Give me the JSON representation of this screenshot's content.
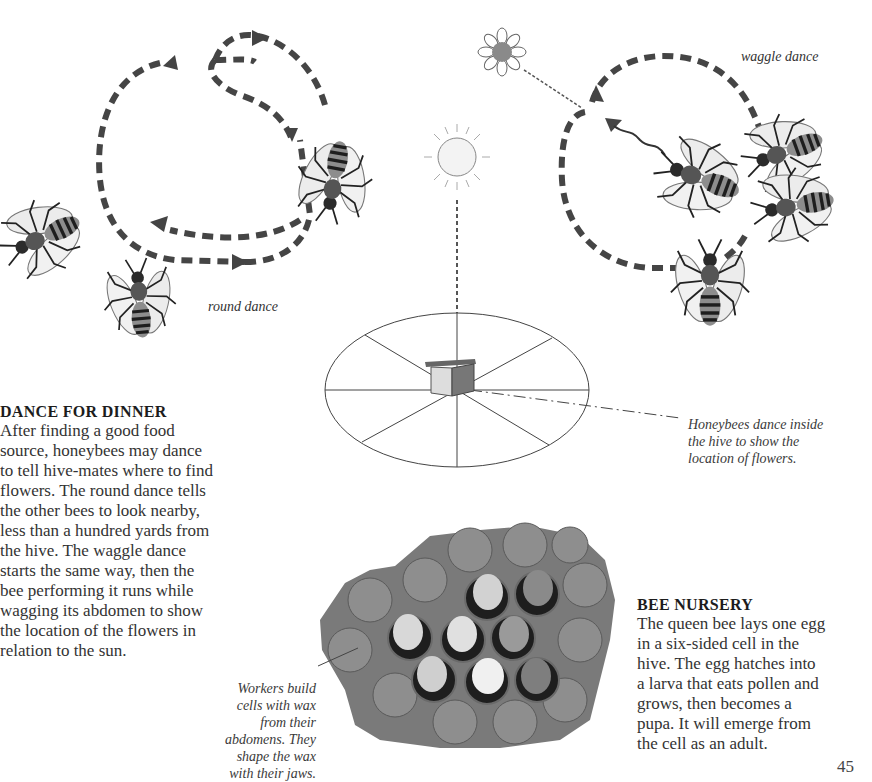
{
  "page_number": "45",
  "illustrations": {
    "round_dance_label": "round dance",
    "waggle_dance_label": "waggle dance",
    "icons": [
      "bee-icon",
      "sun-icon",
      "flower-icon",
      "hive-icon",
      "honeycomb-photo"
    ]
  },
  "hive_caption": {
    "lines": [
      "Honeybees dance inside",
      "the hive to show the",
      "location of flowers."
    ]
  },
  "dance_section": {
    "heading": "DANCE FOR DINNER",
    "lines": [
      "After finding a good food",
      "source, honeybees may dance",
      "to tell hive-mates where to find",
      "flowers. The round dance tells",
      "the other bees to look nearby,",
      "less than a hundred yards from",
      "the hive. The waggle dance",
      "starts the same way, then the",
      "bee performing it runs while",
      "wagging its abdomen to show",
      "the location of the flowers in",
      "relation to the sun."
    ]
  },
  "wax_caption": {
    "lines": [
      "Workers build",
      "cells with wax",
      "from their",
      "abdomens. They",
      "shape the wax",
      "with their jaws."
    ]
  },
  "nursery_section": {
    "heading": "BEE NURSERY",
    "lines": [
      "The queen bee lays one egg",
      "in a six-sided cell in the",
      "hive. The egg hatches into",
      "a larva that eats pollen and",
      "grows, then becomes a",
      "pupa. It will emerge from",
      "the cell as an adult."
    ]
  }
}
